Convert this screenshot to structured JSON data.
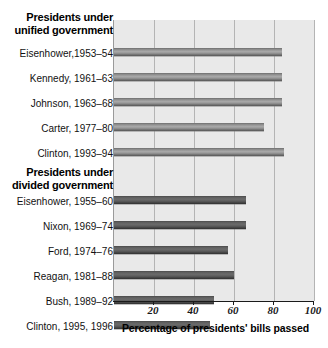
{
  "chart_data": {
    "type": "bar",
    "orientation": "horizontal",
    "title": "",
    "xlabel": "Percentage of presidents' bills passed",
    "ylabel": "",
    "xlim": [
      0,
      100
    ],
    "xticks": [
      20,
      40,
      60,
      80,
      100
    ],
    "xtick_labels": [
      "20",
      "40",
      "60",
      "80",
      "100"
    ],
    "grid": true,
    "legend": "none",
    "groups": [
      {
        "heading": "Presidents under unified government",
        "heading_line1": "Presidents under",
        "heading_line2": "unified government",
        "categories": [
          "Eisenhower,1953–54",
          "Kennedy, 1961–63",
          "Johnson, 1963–68",
          "Carter, 1977–80",
          "Clinton, 1993–94"
        ],
        "values": [
          84,
          84,
          84,
          75,
          85
        ]
      },
      {
        "heading": "Presidents under divided government",
        "heading_line1": "Presidents under",
        "heading_line2": "divided government",
        "categories": [
          "Eisenhower, 1955–60",
          "Nixon, 1969–74",
          "Ford, 1974–76",
          "Reagan, 1981–88",
          "Bush, 1989–92",
          "Clinton, 1995, 1996"
        ],
        "values": [
          66,
          66,
          57,
          60,
          50,
          48
        ]
      }
    ],
    "categories": [
      "Eisenhower,1953–54",
      "Kennedy, 1961–63",
      "Johnson, 1963–68",
      "Carter, 1977–80",
      "Clinton, 1993–94",
      "Eisenhower, 1955–60",
      "Nixon, 1969–74",
      "Ford, 1974–76",
      "Reagan, 1981–88",
      "Bush, 1989–92",
      "Clinton, 1995, 1996"
    ],
    "values": [
      84,
      84,
      84,
      75,
      85,
      66,
      66,
      57,
      60,
      50,
      48
    ],
    "colors": {
      "plot_background": "#e9e9e9",
      "page_background": "#ffffff",
      "bar_unified": "#8c8c8c",
      "bar_divided": "#4a4a4a",
      "gridline": "#b4b4b4",
      "axis": "#1a1a1a",
      "text": "#111111"
    }
  }
}
